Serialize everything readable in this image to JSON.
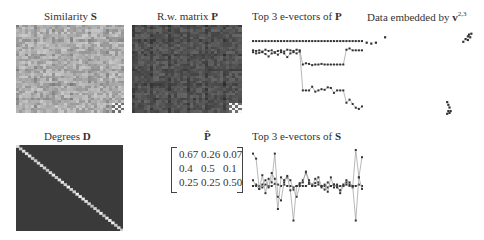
{
  "panels": {
    "similarity": {
      "title_text": "Similarity ",
      "title_bold": "S"
    },
    "rw_matrix": {
      "title_text": "R.w. matrix ",
      "title_bold": "P"
    },
    "evectors_P": {
      "title_text": "Top 3 e-vectors of ",
      "title_bold": "P"
    },
    "embedding": {
      "title_text": "Data embedded by ",
      "title_bold": "v",
      "title_sup": "2,3"
    },
    "degrees": {
      "title_text": "Degrees ",
      "title_bold": "D"
    },
    "p_hat": {
      "title_bold": "P̂"
    },
    "evectors_S": {
      "title_text": "Top 3 e-vectors of ",
      "title_bold": "S"
    }
  },
  "p_hat_matrix": [
    [
      "0.67",
      "0.26",
      "0.07"
    ],
    [
      "0.4",
      "0.5",
      "0.1"
    ],
    [
      "0.25",
      "0.25",
      "0.50"
    ]
  ],
  "colors": {
    "marker": "#333333",
    "line": "#999999",
    "similarity_base": "#b4b4b4",
    "rw_base": "#505050",
    "degree_bg": "#3a3a3a",
    "degree_diag": "#c8c8c8"
  },
  "chart_data": [
    {
      "type": "heatmap",
      "title": "Similarity S",
      "size": 36,
      "description": "grayscale similarity matrix, mostly mid-light gray with block structure; small 4x4 high-contrast block bottom-right"
    },
    {
      "type": "heatmap",
      "title": "R.w. matrix P",
      "size": 36,
      "description": "dark-gray random-walk matrix, faint block structure; small bright block bottom-right"
    },
    {
      "type": "line",
      "title": "Top 3 e-vectors of P",
      "x": [
        1,
        2,
        3,
        4,
        5,
        6,
        7,
        8,
        9,
        10,
        11,
        12,
        13,
        14,
        15,
        16,
        17,
        18,
        19,
        20,
        21,
        22,
        23,
        24,
        25,
        26,
        27,
        28,
        29,
        30,
        31,
        32,
        33,
        34,
        35,
        36
      ],
      "series": [
        {
          "name": "v1",
          "values": [
            1,
            1,
            1,
            1,
            1,
            1,
            1,
            1,
            1,
            1,
            1,
            1,
            1,
            1,
            1,
            1,
            1,
            1,
            1,
            1,
            1,
            1,
            1,
            1,
            1,
            1,
            1,
            1,
            1,
            1,
            1,
            1,
            1,
            1,
            1,
            1
          ]
        },
        {
          "name": "v2",
          "values": [
            0.85,
            0.84,
            0.85,
            0.83,
            0.86,
            0.84,
            0.85,
            0.82,
            0.84,
            0.85,
            0.83,
            0.86,
            0.85,
            0.84,
            0.86,
            0.85,
            0.62,
            0.64,
            0.63,
            0.61,
            0.62,
            0.62,
            0.63,
            0.62,
            0.62,
            0.62,
            0.62,
            0.62,
            0.62,
            0.62,
            0.86,
            0.88,
            0.85,
            0.85,
            0.85,
            0.85
          ]
        },
        {
          "name": "v3",
          "values": [
            0.82,
            0.8,
            0.81,
            0.82,
            0.79,
            0.75,
            0.8,
            0.81,
            0.78,
            0.82,
            0.8,
            0.74,
            0.8,
            0.82,
            0.8,
            0.83,
            0.2,
            0.2,
            0.2,
            0.26,
            0.18,
            0.2,
            0.22,
            0.21,
            0.25,
            0.24,
            0.16,
            0.2,
            0.2,
            0.2,
            0.0,
            0.05,
            -0.02,
            -0.08,
            -0.1,
            -0.06
          ]
        }
      ],
      "ylim": [
        -0.15,
        1.05
      ]
    },
    {
      "type": "scatter",
      "title": "Data embedded by v2,3",
      "clusters": [
        {
          "name": "A",
          "points": [
            [
              0.04,
              0.86
            ],
            [
              0.08,
              0.85
            ],
            [
              0.12,
              0.86
            ],
            [
              0.2,
              0.92
            ]
          ]
        },
        {
          "name": "B",
          "points": [
            [
              0.9,
              0.9
            ],
            [
              0.92,
              0.93
            ],
            [
              0.93,
              0.95
            ],
            [
              0.94,
              0.92
            ],
            [
              0.92,
              0.89
            ],
            [
              0.95,
              0.96
            ],
            [
              0.88,
              0.87
            ]
          ]
        },
        {
          "name": "C",
          "points": [
            [
              0.74,
              0.2
            ],
            [
              0.75,
              0.17
            ],
            [
              0.76,
              0.14
            ],
            [
              0.75,
              0.1
            ],
            [
              0.76,
              0.08
            ],
            [
              0.77,
              0.1
            ],
            [
              0.74,
              0.07
            ]
          ]
        }
      ]
    },
    {
      "type": "heatmap",
      "title": "Degrees D",
      "size": 36,
      "description": "diagonal matrix: dark background, light diagonal"
    },
    {
      "type": "table",
      "title": "P̂",
      "rows": [
        [
          0.67,
          0.26,
          0.07
        ],
        [
          0.4,
          0.5,
          0.1
        ],
        [
          0.25,
          0.25,
          0.5
        ]
      ]
    },
    {
      "type": "line",
      "title": "Top 3 e-vectors of S",
      "x": [
        1,
        2,
        3,
        4,
        5,
        6,
        7,
        8,
        9,
        10,
        11,
        12,
        13,
        14,
        15,
        16,
        17,
        18,
        19,
        20,
        21,
        22,
        23,
        24,
        25,
        26,
        27,
        28,
        29,
        30,
        31,
        32,
        33,
        34,
        35,
        36
      ],
      "series": [
        {
          "name": "v1",
          "values": [
            0.5,
            0.52,
            0.5,
            0.48,
            0.52,
            0.5,
            0.5,
            0.53,
            0.52,
            0.5,
            0.52,
            0.5,
            0.5,
            0.48,
            0.5,
            0.52,
            0.5,
            0.5,
            0.53,
            0.52,
            0.5,
            0.52,
            0.5,
            0.5,
            0.48,
            0.5,
            0.52,
            0.5,
            0.5,
            0.5,
            0.52,
            0.5,
            0.5,
            0.5,
            0.52,
            0.5
          ]
        },
        {
          "name": "v2",
          "values": [
            0.58,
            0.5,
            0.46,
            0.65,
            0.4,
            0.6,
            0.55,
            0.95,
            0.35,
            0.3,
            0.55,
            0.62,
            0.58,
            0.45,
            0.35,
            0.5,
            0.58,
            0.68,
            0.55,
            0.5,
            0.6,
            0.55,
            0.48,
            0.52,
            0.42,
            0.62,
            0.48,
            0.52,
            0.4,
            0.5,
            0.55,
            0.52,
            0.48,
            1.0,
            0.62,
            0.46
          ]
        },
        {
          "name": "v3",
          "values": [
            0.95,
            0.88,
            0.46,
            0.52,
            0.58,
            0.48,
            0.68,
            0.6,
            0.18,
            0.62,
            0.58,
            0.64,
            0.44,
            0.02,
            0.5,
            0.54,
            0.55,
            0.7,
            0.58,
            0.5,
            0.54,
            0.62,
            0.5,
            0.45,
            0.55,
            0.5,
            0.52,
            0.48,
            0.44,
            0.52,
            0.58,
            0.55,
            0.5,
            0.02,
            0.62,
            0.9
          ]
        }
      ],
      "ylim": [
        0,
        1
      ]
    }
  ]
}
